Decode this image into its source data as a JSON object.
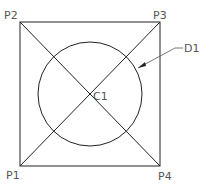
{
  "diagram": {
    "labels": {
      "p1": "P1",
      "p2": "P2",
      "p3": "P3",
      "p4": "P4",
      "c1": "C1",
      "d1": "D1"
    },
    "stroke_color": "#222222",
    "label_color": "#555555"
  }
}
